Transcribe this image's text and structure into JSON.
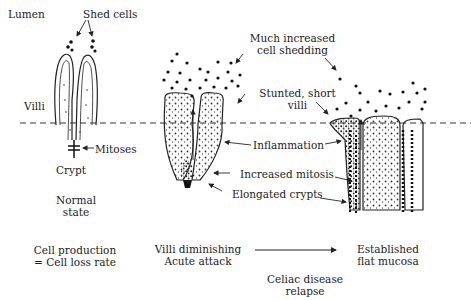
{
  "diagram": {
    "labels": {
      "lumen": "Lumen",
      "shed_cells": "Shed cells",
      "villi": "Villi",
      "mitoses": "Mitoses",
      "crypt": "Crypt",
      "much_increased_line1": "Much increased",
      "much_increased_line2": "cell shedding",
      "stunted_line1": "Stunted, short",
      "stunted_line2": "villi",
      "inflammation": "Inflammation",
      "increased_mitosis": "Increased mitosis",
      "elongated_crypts": "Elongated crypts"
    },
    "stages": [
      {
        "state_line1": "Normal",
        "state_line2": "state",
        "caption_line1": "Cell production",
        "caption_line2": "= Cell loss rate"
      },
      {
        "caption_line1": "Villi diminishing",
        "caption_line2": "Acute attack"
      },
      {
        "caption_line1": "Established",
        "caption_line2": "flat mucosa"
      }
    ],
    "transition": {
      "line1": "Celiac disease",
      "line2": "relapse"
    }
  }
}
